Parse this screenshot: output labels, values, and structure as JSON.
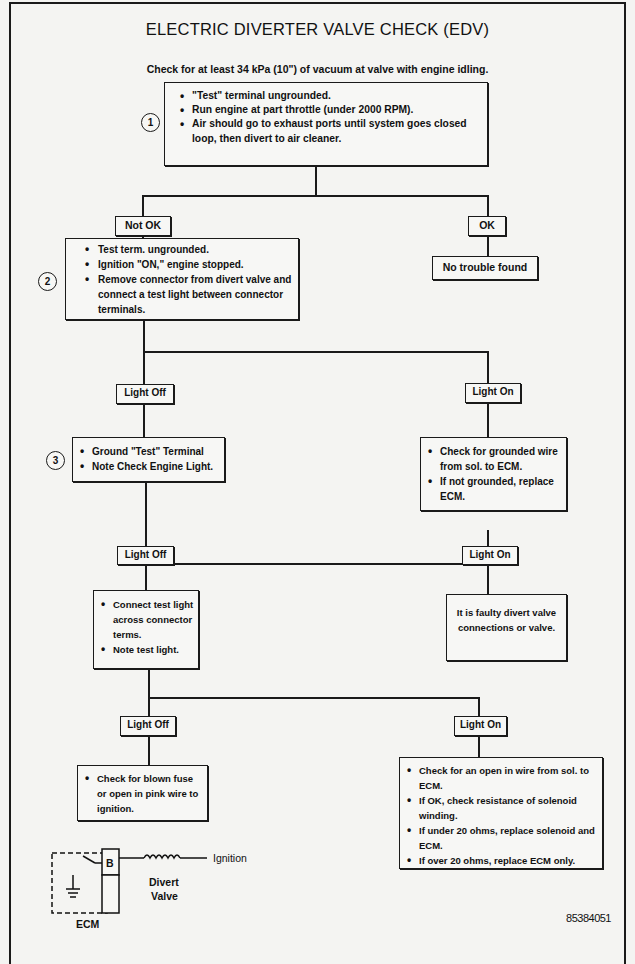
{
  "diagram": {
    "title": "ELECTRIC DIVERTER VALVE CHECK (EDV)",
    "subtitle": "Check for at least 34 kPa (10\") of vacuum at valve with engine idling.",
    "figure_id": "85384051",
    "steps": [
      {
        "number": "1",
        "items": [
          "\"Test\" terminal ungrounded.",
          "Run engine at part throttle (under 2000 RPM).",
          "Air should go to exhaust ports until system goes closed loop, then divert to air cleaner."
        ]
      },
      {
        "number": "2",
        "items": [
          "Test term. ungrounded.",
          "Ignition \"ON,\" engine stopped.",
          "Remove connector from divert valve and connect a test light between connector terminals."
        ]
      },
      {
        "number": "3",
        "items": [
          "Ground \"Test\" Terminal",
          "Note Check Engine Light."
        ]
      }
    ],
    "branches": {
      "b1_left": "Not OK",
      "b1_right": "OK",
      "b2_left": "Light Off",
      "b2_right": "Light On",
      "b3_left": "Light Off",
      "b3_right": "Light On",
      "b4_left": "Light Off",
      "b4_right": "Light On"
    },
    "outcomes": {
      "no_trouble": "No trouble found",
      "grounded_wire": [
        "Check for grounded wire from sol. to ECM.",
        "If not grounded, replace ECM."
      ],
      "connect_test_light": [
        "Connect test light across connector terms.",
        "Note test light."
      ],
      "faulty_valve": "It is faulty divert valve connections or valve.",
      "blown_fuse": [
        "Check for blown fuse or open in pink wire to ignition."
      ],
      "open_wire": [
        "Check for an open in wire from sol. to ECM.",
        "If OK, check resistance of solenoid winding.",
        "If under 20 ohms, replace solenoid and ECM.",
        "If over 20 ohms, replace ECM only."
      ]
    },
    "circuit": {
      "ecm_label": "ECM",
      "terminal_label": "B",
      "valve_label_line1": "Divert",
      "valve_label_line2": "Valve",
      "ignition_label": "Ignition"
    }
  }
}
